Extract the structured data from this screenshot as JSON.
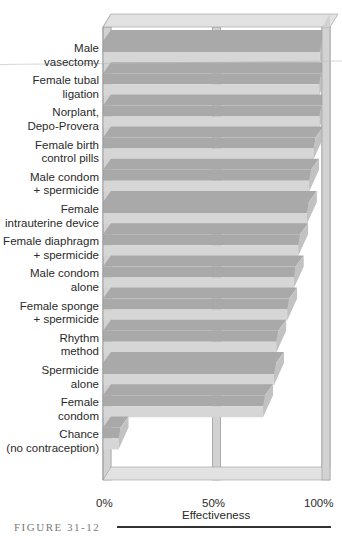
{
  "chart_data": {
    "type": "bar",
    "orientation": "horizontal",
    "style": "3d",
    "title": "",
    "figure_label": "FIGURE 31-12",
    "xlabel": "Effectiveness",
    "ylabel": "",
    "xlim": [
      0,
      100
    ],
    "x_ticks": [
      "0%",
      "50%",
      "100%"
    ],
    "grid": true,
    "legend": null,
    "categories": [
      "Male vasectomy",
      "Female tubal ligation",
      "Norplant, Depo-Provera",
      "Female birth control pills",
      "Male condom + spermicide",
      "Female intrauterine device",
      "Female diaphragm + spermicide",
      "Male condom alone",
      "Female sponge + spermicide",
      "Rhythm method",
      "Spermicide alone",
      "Female condom",
      "Chance (no contraception)"
    ],
    "category_lines": [
      [
        "Male",
        "vasectomy"
      ],
      [
        "Female tubal",
        "ligation"
      ],
      [
        "Norplant,",
        "Depo-Provera"
      ],
      [
        "Female birth",
        "control pills"
      ],
      [
        "Male condom",
        "+ spermicide"
      ],
      [
        "Female",
        "intrauterine device"
      ],
      [
        "Female diaphragm",
        "+ spermicide"
      ],
      [
        "Male condom",
        "alone"
      ],
      [
        "Female sponge",
        "+ spermicide"
      ],
      [
        "Rhythm",
        "method"
      ],
      [
        "Spermicide",
        "alone"
      ],
      [
        "Female",
        "condom"
      ],
      [
        "Chance",
        "(no contraception)"
      ]
    ],
    "values": [
      99.9,
      99.6,
      99.7,
      97,
      95,
      94,
      90,
      88,
      85,
      80,
      79,
      74,
      8
    ]
  },
  "colors": {
    "bar_top": "#a9a9a9",
    "bar_front": "#d6d6d6",
    "bar_end": "#c2c2c2",
    "frame": "#d2d2d2",
    "frame_edge": "#9a9a9a",
    "frame_top": "#e2e2e2"
  },
  "axis": {
    "tick_0": "0%",
    "tick_50": "50%",
    "tick_100": "100%",
    "title": "Effectiveness"
  },
  "figure": {
    "label": "FIGURE 31-12"
  }
}
